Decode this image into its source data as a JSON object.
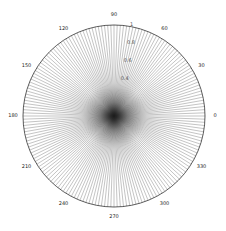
{
  "chart_data": {
    "type": "polar",
    "title": "",
    "center": [
      114,
      116
    ],
    "radius_px": 91,
    "rlim": [
      0,
      1
    ],
    "spoke_step_deg": 2,
    "angle_ticks": [
      0,
      30,
      60,
      90,
      120,
      150,
      180,
      210,
      240,
      270,
      300,
      330
    ],
    "angle_tick_labels": [
      "0",
      "30",
      "60",
      "90",
      "120",
      "150",
      "180",
      "210",
      "240",
      "270",
      "300",
      "330"
    ],
    "radial_ticks": [
      0.4,
      0.6,
      0.8,
      1
    ],
    "radial_tick_labels": [
      "0.4",
      "0.6",
      "0.8",
      "1"
    ],
    "radial_label_angle_deg": 80,
    "series": [
      {
        "name": "spokes",
        "description": "radial lines from origin to r=1 at every 2 degrees",
        "color": "#555555"
      }
    ],
    "grid": true,
    "legend": null
  }
}
